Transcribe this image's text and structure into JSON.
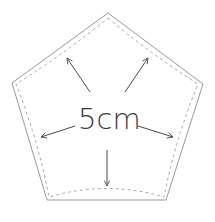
{
  "diagram": {
    "type": "pentagon-pattern",
    "label": "5cm",
    "colors": {
      "outline": "#9a9a9a",
      "seam": "#a8a8a8",
      "arrow": "#4a4a4a",
      "text": "#3a3a3a",
      "background": "#ffffff"
    },
    "outer_pentagon": [
      [
        108,
        13
      ],
      [
        203,
        84
      ],
      [
        166,
        200
      ],
      [
        47,
        200
      ],
      [
        12,
        83
      ]
    ],
    "arrows": [
      {
        "name": "arrow-up-left",
        "from": [
          90,
          92
        ],
        "to": [
          67,
          58
        ]
      },
      {
        "name": "arrow-up-right",
        "from": [
          125,
          92
        ],
        "to": [
          148,
          58
        ]
      },
      {
        "name": "arrow-left",
        "from": [
          75,
          126
        ],
        "to": [
          41,
          137
        ]
      },
      {
        "name": "arrow-right",
        "from": [
          138,
          126
        ],
        "to": [
          173,
          137
        ]
      },
      {
        "name": "arrow-down",
        "from": [
          107,
          150
        ],
        "to": [
          107,
          186
        ]
      }
    ]
  }
}
